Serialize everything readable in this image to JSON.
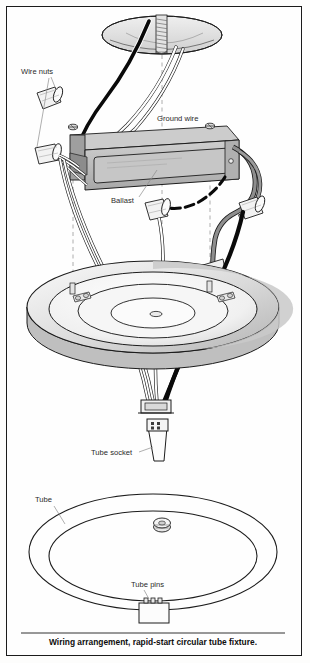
{
  "figure": {
    "caption": "Wiring arrangement, rapid-start circular tube fixture.",
    "border_color": "#1b1b1b",
    "background": "#fefefe"
  },
  "labels": {
    "wire_nuts": "Wire nuts",
    "ground_wire": "Ground wire",
    "ballast": "Ballast",
    "tube_socket": "Tube socket",
    "tube": "Tube",
    "tube_pins": "Tube pins"
  },
  "colors": {
    "outline": "#1c1c1c",
    "black_wire": "#0a0a0a",
    "white_wire": "#ffffff",
    "gray_wire": "#8e8e8e",
    "ballast_body": "#b9b9b9",
    "ballast_panel": "#c9c9c9",
    "pan_light": "#f4f4f4",
    "pan_shadow": "#c2c2c2",
    "canopy_shade": "#d6d6d6",
    "dashed_guide": "#9a9a9a"
  },
  "components": {
    "ceiling_box": "ceiling-outlet-box",
    "mounting_stud": "threaded-mounting-stud",
    "ballast": "fluorescent-ballast",
    "wire_nut_count": 4,
    "fixture_pan": "circular-fixture-pan",
    "socket_pins": 4,
    "tube": "circular-fluorescent-tube",
    "tube_pin_block": "tube-pin-connector"
  }
}
